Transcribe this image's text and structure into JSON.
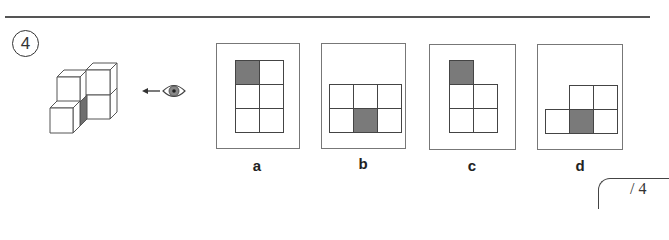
{
  "question": {
    "number": "4",
    "view_direction_icon": "eye-icon",
    "arrow_icon": "arrow-left-icon",
    "shade_color": "#7a7a7a"
  },
  "options": [
    {
      "label": "a",
      "cells": [
        [
          0,
          0,
          1
        ],
        [
          1,
          0,
          0
        ],
        [
          0,
          1,
          0
        ],
        [
          1,
          1,
          0
        ],
        [
          0,
          2,
          0
        ],
        [
          1,
          2,
          0
        ]
      ]
    },
    {
      "label": "b",
      "cells": [
        [
          0,
          0,
          0
        ],
        [
          1,
          0,
          0
        ],
        [
          2,
          0,
          0
        ],
        [
          0,
          1,
          0
        ],
        [
          1,
          1,
          1
        ],
        [
          2,
          1,
          0
        ]
      ]
    },
    {
      "label": "c",
      "cells": [
        [
          0,
          0,
          1
        ],
        [
          0,
          1,
          0
        ],
        [
          1,
          1,
          0
        ],
        [
          0,
          2,
          0
        ],
        [
          1,
          2,
          0
        ]
      ]
    },
    {
      "label": "d",
      "cells": [
        [
          1,
          0,
          0
        ],
        [
          2,
          0,
          0
        ],
        [
          0,
          1,
          0
        ],
        [
          1,
          1,
          1
        ],
        [
          2,
          1,
          0
        ]
      ]
    }
  ],
  "score": {
    "text": "/ 4"
  }
}
